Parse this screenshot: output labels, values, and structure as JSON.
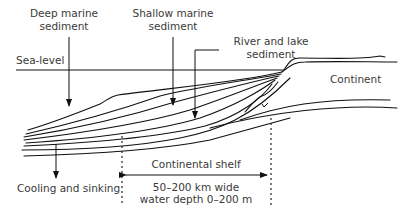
{
  "diagram": {
    "labels": {
      "deep_marine_line1": "Deep marine",
      "deep_marine_line2": "sediment",
      "shallow_marine_line1": "Shallow marine",
      "shallow_marine_line2": "sediment",
      "river_lake_line1": "River and lake",
      "river_lake_line2": "sediment",
      "sea_level": "Sea-level",
      "continent": "Continent",
      "cooling": "Cooling and sinking",
      "shelf_title": "Continental shelf",
      "shelf_width": "50–200 km wide",
      "shelf_depth": "water depth 0–200 m"
    },
    "colors": {
      "line": "#111111",
      "text": "#3a3a3a",
      "background": "#ffffff"
    }
  }
}
